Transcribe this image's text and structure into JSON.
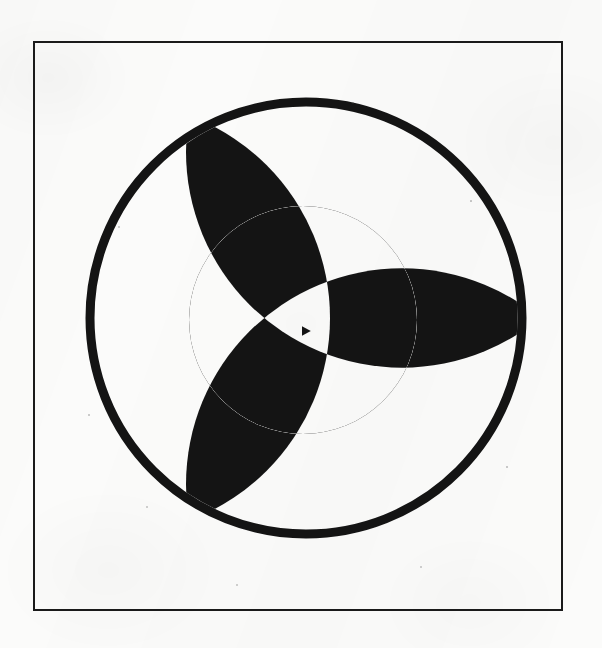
{
  "document": {
    "title": "Geometric trefoil figure",
    "medium": "scanned line drawing",
    "background_color": "#fbfbfa",
    "ink_color": "#141414"
  },
  "frame": {
    "name": "rectangular border",
    "x": 34,
    "y": 42,
    "width": 528,
    "height": 568,
    "stroke_width": 2,
    "stroke_color": "#1a1a1a",
    "fill": "none"
  },
  "figure": {
    "name": "trefoil rosette in circle",
    "symmetry": "3-fold rotational",
    "rotation_offset_deg": 0,
    "outer_circle": {
      "label": "outer circle ring",
      "cx": 306,
      "cy": 318,
      "r": 216,
      "stroke_width": 9,
      "stroke_color": "#141414",
      "fill": "none"
    },
    "inner_disc": {
      "label": "inner filled disc",
      "cx": 303,
      "cy": 320,
      "r": 114,
      "fill": "#141414"
    },
    "petal_arcs": {
      "label": "three large construction arcs",
      "count": 3,
      "arc_radius": 216,
      "center_distance": 192,
      "center_angles_deg": [
        60,
        180,
        300
      ],
      "tip_angles_deg": [
        0,
        120,
        240
      ],
      "tips": [
        {
          "label": "right petal tip",
          "x": 521,
          "y": 320
        },
        {
          "label": "upper-left petal tip",
          "x": 200,
          "y": 126
        },
        {
          "label": "lower-left petal tip",
          "x": 200,
          "y": 507
        }
      ]
    },
    "convergence_point": {
      "label": "central convergence node",
      "x": 306,
      "y": 331,
      "size": 8
    }
  },
  "regions": {
    "description": "Overlapping of the three arc lenses with the inner disc produces alternating black and white lens-shaped cells",
    "black_count": 6,
    "white_count": 6
  },
  "specks": [
    {
      "x": 146,
      "y": 506,
      "d": 2.2
    },
    {
      "x": 420,
      "y": 566,
      "d": 2.0
    },
    {
      "x": 118,
      "y": 226,
      "d": 1.8
    },
    {
      "x": 470,
      "y": 200,
      "d": 1.7
    },
    {
      "x": 236,
      "y": 584,
      "d": 2.4
    },
    {
      "x": 506,
      "y": 466,
      "d": 1.6
    },
    {
      "x": 88,
      "y": 414,
      "d": 1.5
    },
    {
      "x": 352,
      "y": 102,
      "d": 1.5
    }
  ]
}
